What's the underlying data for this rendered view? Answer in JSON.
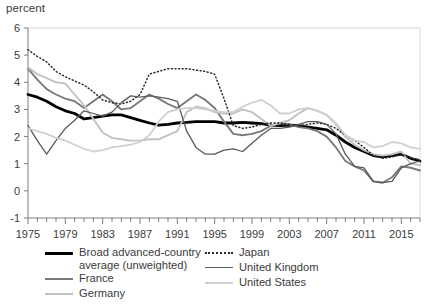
{
  "chart_data": {
    "type": "line",
    "title": "",
    "ylabel": "percent",
    "xlabel": "",
    "ylim": [
      -1,
      6
    ],
    "xlim": [
      1975,
      2017
    ],
    "yticks": [
      -1,
      0,
      1,
      2,
      3,
      4,
      5,
      6
    ],
    "xticks": [
      1975,
      1979,
      1983,
      1987,
      1991,
      1995,
      1999,
      2003,
      2007,
      2011,
      2015
    ],
    "xtick_minor_step": 1,
    "grid": false,
    "legend_position": "bottom",
    "x": [
      1975,
      1976,
      1977,
      1978,
      1979,
      1980,
      1981,
      1982,
      1983,
      1984,
      1985,
      1986,
      1987,
      1988,
      1989,
      1990,
      1991,
      1992,
      1993,
      1994,
      1995,
      1996,
      1997,
      1998,
      1999,
      2000,
      2001,
      2002,
      2003,
      2004,
      2005,
      2006,
      2007,
      2008,
      2009,
      2010,
      2011,
      2012,
      2013,
      2014,
      2015,
      2016,
      2017
    ],
    "series": [
      {
        "name": "Broad advanced-country average (unweighted)",
        "color": "#000000",
        "width": 2.8,
        "dash": "none",
        "values": [
          3.55,
          3.45,
          3.3,
          3.1,
          2.95,
          2.85,
          2.65,
          2.7,
          2.75,
          2.8,
          2.8,
          2.7,
          2.6,
          2.5,
          2.42,
          2.45,
          2.5,
          2.52,
          2.55,
          2.55,
          2.55,
          2.5,
          2.5,
          2.52,
          2.5,
          2.48,
          2.42,
          2.4,
          2.42,
          2.4,
          2.35,
          2.3,
          2.25,
          2.05,
          1.8,
          1.6,
          1.45,
          1.3,
          1.25,
          1.3,
          1.35,
          1.2,
          1.1
        ]
      },
      {
        "name": "France",
        "color": "#7a7a7a",
        "width": 1.9,
        "dash": "none",
        "values": [
          4.5,
          4.1,
          3.75,
          3.55,
          3.4,
          3.3,
          3.05,
          3.3,
          3.55,
          3.3,
          3.0,
          3.05,
          3.3,
          3.55,
          3.4,
          3.2,
          3.05,
          3.3,
          3.55,
          3.35,
          3.05,
          2.55,
          2.1,
          2.05,
          2.1,
          2.2,
          2.4,
          2.5,
          2.45,
          2.35,
          2.3,
          2.2,
          2.0,
          1.6,
          1.1,
          0.9,
          0.75,
          0.35,
          0.3,
          0.5,
          0.9,
          0.85,
          0.75
        ]
      },
      {
        "name": "Germany",
        "color": "#c2c2c2",
        "width": 1.9,
        "dash": "none",
        "values": [
          4.55,
          4.3,
          4.15,
          4.0,
          3.95,
          3.55,
          3.15,
          2.65,
          2.15,
          1.95,
          1.9,
          1.85,
          1.85,
          1.9,
          1.9,
          2.05,
          2.2,
          2.9,
          3.1,
          3.05,
          2.9,
          2.85,
          2.85,
          3.0,
          2.9,
          2.65,
          2.4,
          2.5,
          2.6,
          2.85,
          3.05,
          2.95,
          2.8,
          2.45,
          2.0,
          1.7,
          1.5,
          1.35,
          1.3,
          1.35,
          1.45,
          1.0,
          0.95
        ]
      },
      {
        "name": "Japan",
        "color": "#2b2b2b",
        "width": 1.5,
        "dash": "1,2.6",
        "values": [
          5.2,
          4.95,
          4.75,
          4.4,
          4.2,
          4.05,
          3.9,
          3.65,
          3.35,
          3.25,
          3.2,
          3.3,
          3.55,
          4.3,
          4.4,
          4.5,
          4.5,
          4.5,
          4.45,
          4.4,
          4.3,
          3.4,
          2.4,
          2.3,
          2.35,
          2.45,
          2.5,
          2.5,
          2.45,
          2.4,
          2.45,
          2.5,
          2.45,
          2.3,
          2.05,
          1.85,
          1.6,
          1.3,
          1.2,
          1.25,
          1.35,
          1.2,
          1.15
        ]
      },
      {
        "name": "United Kingdom",
        "color": "#5a5a5a",
        "width": 1.3,
        "dash": "none",
        "values": [
          2.4,
          1.85,
          1.35,
          1.85,
          2.3,
          2.6,
          2.95,
          2.85,
          2.75,
          2.9,
          3.25,
          3.5,
          3.45,
          3.5,
          3.45,
          3.4,
          3.3,
          2.2,
          1.6,
          1.35,
          1.35,
          1.5,
          1.55,
          1.45,
          1.75,
          2.05,
          2.3,
          2.3,
          2.35,
          2.45,
          2.55,
          2.55,
          2.45,
          2.1,
          1.35,
          0.9,
          0.85,
          0.35,
          0.3,
          0.35,
          0.85,
          1.0,
          1.1
        ]
      },
      {
        "name": "United States",
        "color": "#d0d0d0",
        "width": 1.8,
        "dash": "none",
        "values": [
          2.3,
          2.2,
          2.1,
          1.95,
          1.85,
          1.7,
          1.55,
          1.45,
          1.5,
          1.6,
          1.65,
          1.7,
          1.8,
          2.05,
          2.55,
          2.9,
          3.0,
          3.05,
          3.05,
          3.0,
          2.95,
          2.9,
          2.9,
          3.1,
          3.25,
          3.35,
          3.15,
          2.85,
          2.85,
          3.0,
          3.05,
          2.95,
          2.8,
          2.5,
          2.05,
          1.85,
          1.8,
          1.6,
          1.65,
          1.8,
          1.75,
          1.6,
          1.55
        ]
      }
    ]
  },
  "legend": {
    "left_items": [
      {
        "label": "Broad advanced-country\naverage (unweighted)",
        "name": "legend-item-broad-average"
      },
      {
        "label": "France",
        "name": "legend-item-france"
      },
      {
        "label": "Germany",
        "name": "legend-item-germany"
      }
    ],
    "right_items": [
      {
        "label": "Japan",
        "name": "legend-item-japan"
      },
      {
        "label": "United Kingdom",
        "name": "legend-item-united-kingdom"
      },
      {
        "label": "United States",
        "name": "legend-item-united-states"
      }
    ]
  }
}
